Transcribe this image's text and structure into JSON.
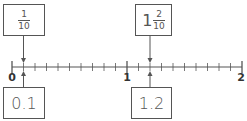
{
  "number_line": {
    "min": 0,
    "max": 2,
    "minor_step": 0.1,
    "major_labels": [
      "0",
      "1",
      "2"
    ],
    "major_values": [
      0,
      1,
      2
    ]
  },
  "top_boxes": [
    {
      "type": "fraction",
      "numerator": "1",
      "denominator": "10",
      "points_to": 0.1
    },
    {
      "type": "mixed",
      "whole": "1",
      "numerator": "2",
      "denominator": "10",
      "points_to": 1.2
    }
  ],
  "bottom_boxes": [
    {
      "label": "0.1",
      "points_to": 0.1
    },
    {
      "label": "1.2",
      "points_to": 1.2
    }
  ],
  "colors": {
    "stroke": "#555555",
    "label": "#333333"
  }
}
